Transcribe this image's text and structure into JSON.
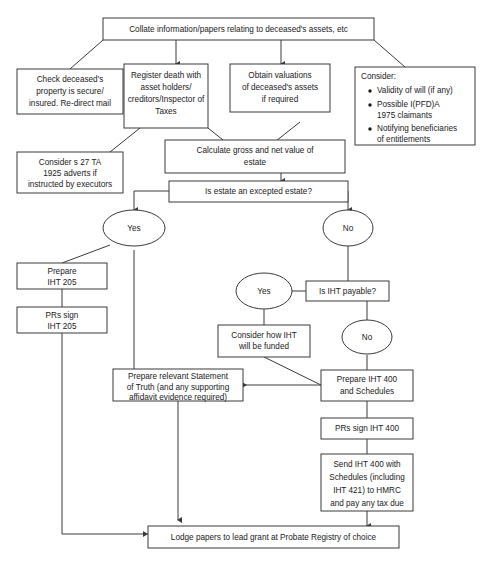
{
  "diagram": {
    "title_fragment": "",
    "bg_color": "#ffffff",
    "line_color": "#3a3a3a",
    "text_color": "#1a1a1a"
  },
  "nodes": {
    "collate": {
      "line1": "Collate information/papers relating to deceased's assets, etc"
    },
    "check_property": {
      "line1": "Check deceased's",
      "line2": "property is secure/",
      "line3": "insured. Re-direct mail"
    },
    "register_death": {
      "line1": "Register death with",
      "line2": "asset holders/",
      "line3": "creditors/Inspector of",
      "line4": "Taxes"
    },
    "obtain_valuations": {
      "line1": "Obtain valuations",
      "line2": "of deceased's assets",
      "line3": "if required"
    },
    "consider_list": {
      "heading": "Consider:",
      "items": [
        [
          "Validity of will (if any)"
        ],
        [
          "Possible I(PFD)A",
          "1975 claimants"
        ],
        [
          "Notifying beneficiaries",
          "of entitlements"
        ]
      ]
    },
    "consider_s27": {
      "line1": "Consider s 27 TA",
      "line2": "1925 adverts if",
      "line3": "instructed by executors"
    },
    "calculate_value": {
      "line1": "Calculate gross and net value of",
      "line2": "estate"
    },
    "excepted_estate": {
      "line1": "Is estate an excepted estate?"
    },
    "yes_excepted": {
      "label": "Yes"
    },
    "no_excepted": {
      "label": "No"
    },
    "prepare_205": {
      "line1": "Prepare",
      "line2": "IHT 205"
    },
    "prs_sign_205": {
      "line1": "PRs sign",
      "line2": "IHT 205"
    },
    "iht_payable": {
      "line1": "Is IHT payable?"
    },
    "yes_iht": {
      "label": "Yes"
    },
    "no_iht": {
      "label": "No"
    },
    "consider_funding": {
      "line1": "Consider how IHT",
      "line2": "will be funded"
    },
    "statement_of_truth": {
      "line1": "Prepare relevant Statement",
      "line2": "of Truth (and any supporting",
      "line3": "affidavit evidence required)"
    },
    "prepare_400": {
      "line1": "Prepare IHT 400",
      "line2": "and Schedules"
    },
    "prs_sign_400": {
      "line1": "PRs sign IHT 400"
    },
    "send_400": {
      "line1": "Send IHT 400 with",
      "line2": "Schedules (including",
      "line3": "IHT 421) to HMRC",
      "line4": "and pay any tax due"
    },
    "lodge_papers": {
      "line1": "Lodge papers to lead grant at Probate Registry of choice"
    }
  }
}
